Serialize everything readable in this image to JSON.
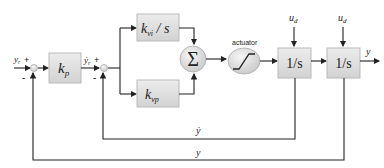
{
  "diagram": {
    "type": "control-block-diagram",
    "inputs": {
      "reference_position": "y",
      "reference_position_sub": "r",
      "reference_velocity": "ẏ",
      "reference_velocity_sub": "r"
    },
    "signs": {
      "sum1_plus": "+",
      "sum1_minus": "-",
      "sum2_plus": "+",
      "sum2_minus": "-"
    },
    "blocks": {
      "kp": {
        "main": "k",
        "sub": "p"
      },
      "kvi": {
        "main": "k",
        "sub": "vi",
        "suffix": " / s"
      },
      "kvp": {
        "main": "k",
        "sub": "vp"
      },
      "sum": "Σ",
      "actuator_label": "actuator",
      "integrator1": "1/s",
      "integrator2": "1/s"
    },
    "disturbances": {
      "ud1": {
        "main": "u",
        "sub": "d"
      },
      "ud2": {
        "main": "u",
        "sub": "d"
      }
    },
    "outputs": {
      "y": "y"
    },
    "feedback": {
      "velocity": "ẏ",
      "position": "y"
    }
  }
}
